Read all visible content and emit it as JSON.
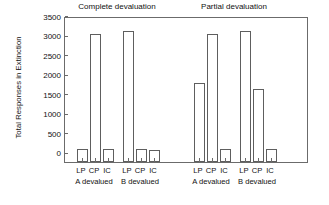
{
  "chart_data": {
    "type": "bar",
    "title": "",
    "xlabel": "",
    "ylabel": "Total Responses in Extinction",
    "ylim": [
      0,
      3700
    ],
    "yticks": [
      0,
      500,
      1000,
      1500,
      2000,
      2500,
      3000,
      3500
    ],
    "ytick_labels": [
      "0",
      "500",
      "1000",
      "1500",
      "2000",
      "2500",
      "3000",
      "3500"
    ],
    "grid": false,
    "legend": "none",
    "panels": [
      {
        "title": "Complete devaluation",
        "groups": [
          {
            "label": "A devalued",
            "categories": [
              "LP",
              "CP",
              "IC"
            ],
            "values": [
              340,
              3300,
              340
            ]
          },
          {
            "label": "B devalued",
            "categories": [
              "LP",
              "CP",
              "IC"
            ],
            "values": [
              3370,
              340,
              300
            ]
          }
        ]
      },
      {
        "title": "Partial devaluation",
        "groups": [
          {
            "label": "A devalued",
            "categories": [
              "LP",
              "CP",
              "IC"
            ],
            "values": [
              2020,
              3300,
              330
            ]
          },
          {
            "label": "B devalued",
            "categories": [
              "LP",
              "CP",
              "IC"
            ],
            "values": [
              3370,
              1880,
              330
            ]
          }
        ]
      }
    ]
  },
  "colors": {
    "bar_fill": "#ffffff",
    "bar_edge": "#5e5e5e",
    "axis": "#6b6b6b",
    "text": "#111111",
    "background": "#ffffff"
  }
}
